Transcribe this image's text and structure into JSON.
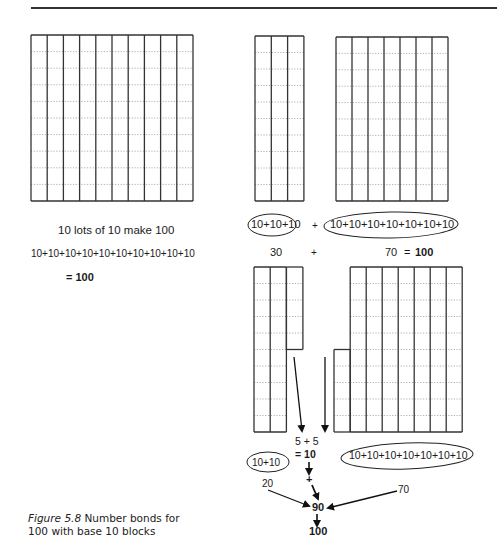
{
  "figure": {
    "caption_label": "Figure 5.8",
    "caption_text_line1": "Number bonds for",
    "caption_text_line2": "100 with base 10 blocks"
  },
  "left_panel": {
    "block": {
      "columns": 10,
      "rows": 10,
      "description": "10 by 10 hundred square"
    },
    "line1": "10 lots of 10 make 100",
    "line2": "10+10+10+10+10+10+10+10+10+10",
    "line3": "= 100"
  },
  "right_top": {
    "block_a": {
      "columns": 3,
      "rows": 10
    },
    "block_b": {
      "columns": 7,
      "rows": 10
    },
    "expr_a": "10+10+10",
    "plus": "+",
    "expr_b": "10+10+10+10+10+10+10",
    "sum_a": "30",
    "sum_plus": "+",
    "sum_b": "70",
    "sum_eq": "=",
    "sum_total": "100"
  },
  "right_bottom": {
    "block_a": {
      "full_columns": 2,
      "half_column_units": 5
    },
    "block_b": {
      "full_columns": 7,
      "half_column_units": 5
    },
    "halves_sum": "5 + 5",
    "halves_result": "= 10",
    "expr_a": "10+10",
    "expr_b": "10+10+10+10+10+10+10",
    "plus": "+",
    "label_20": "20",
    "label_70": "70",
    "label_90": "90",
    "label_100": "100"
  },
  "colors": {
    "line": "#333333",
    "dotted": "#9a9a9a",
    "text": "#1a1a1a"
  }
}
